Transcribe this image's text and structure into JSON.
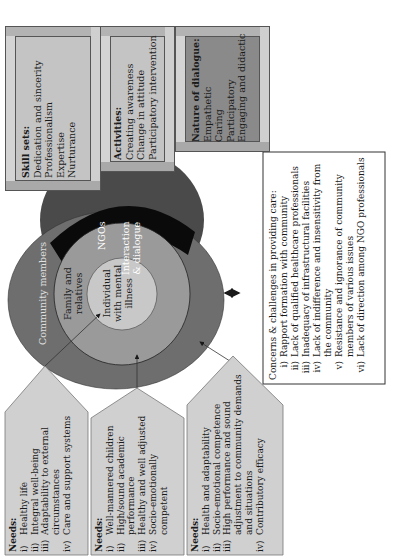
{
  "colors": {
    "bevel_box": "#c4c4c4",
    "bevel_box_dark": "#8a8a8a",
    "ngo_circle": "#4a4a4a",
    "ngo_band": "#0a0a0a",
    "community_ring": "#6e6e6e",
    "family_ring": "#9a9a9a",
    "individual_core": "#c8c8c8",
    "needs_box": "#d0d0d0",
    "concerns_box": "#ffffff"
  },
  "top_boxes": [
    {
      "heading": "Skill sets:",
      "items": [
        "Dedication and sincerity",
        "Professionalism",
        "Expertise",
        "Nurturance"
      ]
    },
    {
      "heading": "Activities:",
      "items": [
        "Creating awareness",
        "Change in attitude",
        "Participatory intervention"
      ]
    },
    {
      "heading": "Nature of dialogue:",
      "items": [
        "Empathetic",
        "Caring",
        "Participatory",
        "Engaging and didactic"
      ]
    }
  ],
  "circles": {
    "ngo_label": "NGOs",
    "interaction_label": [
      "Interaction",
      "& dialogue"
    ],
    "community_label": "Community members",
    "family_label": [
      "Family and",
      "relatives"
    ],
    "individual_label": [
      "Individual",
      "with mental",
      "illness"
    ]
  },
  "needs_boxes": [
    {
      "heading": "Needs:",
      "items": [
        {
          "num": "i)",
          "lines": [
            "Healthy life"
          ]
        },
        {
          "num": "ii)",
          "lines": [
            "Integral well-being"
          ]
        },
        {
          "num": "iii)",
          "lines": [
            "Adaptability to external",
            "circumstances"
          ]
        },
        {
          "num": "iv)",
          "lines": [
            "Care and support systems"
          ]
        }
      ]
    },
    {
      "heading": "Needs:",
      "items": [
        {
          "num": "i)",
          "lines": [
            "Well-mannered children"
          ]
        },
        {
          "num": "ii)",
          "lines": [
            "High/sound academic",
            "performance"
          ]
        },
        {
          "num": "iii)",
          "lines": [
            "Healthy and well adjusted"
          ]
        },
        {
          "num": "iv)",
          "lines": [
            "Socio-emotionally",
            "competent"
          ]
        }
      ]
    },
    {
      "heading": "Needs:",
      "items": [
        {
          "num": "i)",
          "lines": [
            "Health and adaptability"
          ]
        },
        {
          "num": "ii)",
          "lines": [
            "Socio-emotional competence"
          ]
        },
        {
          "num": "iii)",
          "lines": [
            "High performance and sound",
            "adjustment to community demands",
            "and situations"
          ]
        },
        {
          "num": "iv)",
          "lines": [
            "Contributory efficacy"
          ]
        }
      ]
    }
  ],
  "concerns": {
    "heading": "Concerns & challenges in providing care:",
    "items": [
      {
        "num": "i)",
        "lines": [
          "Rapport formation with community"
        ]
      },
      {
        "num": "ii)",
        "lines": [
          "Lack of qualified healthcare professionals"
        ]
      },
      {
        "num": "iii)",
        "lines": [
          "Inadequacy of infrastructural facilities"
        ]
      },
      {
        "num": "iv)",
        "lines": [
          "Lack of indifference and insensitivity from",
          "the community"
        ]
      },
      {
        "num": "v)",
        "lines": [
          "Resistance and ignorance of community",
          "members of various issues"
        ]
      },
      {
        "num": "vi)",
        "lines": [
          "Lack of direction among NGO professionals"
        ]
      }
    ]
  }
}
